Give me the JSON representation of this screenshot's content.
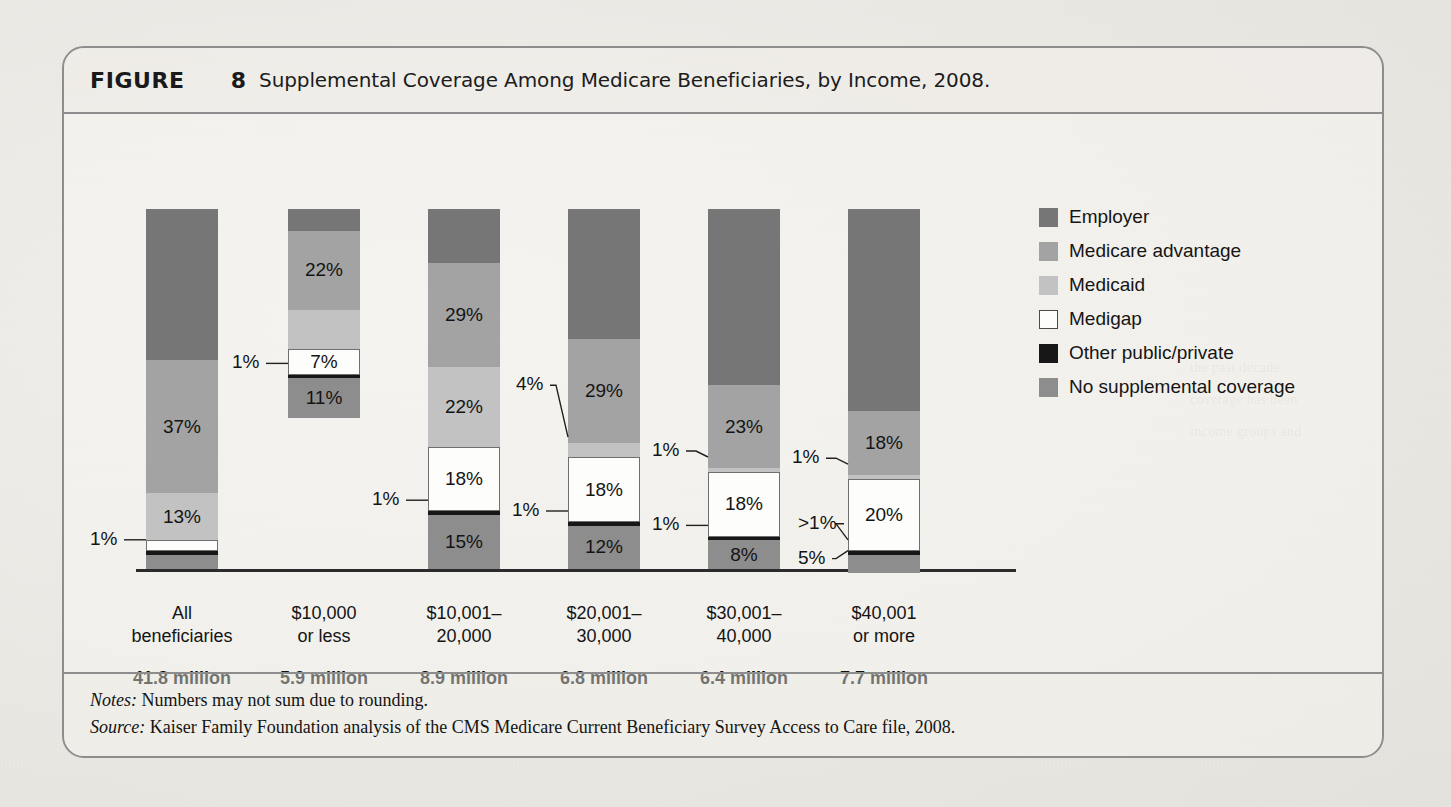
{
  "figure": {
    "label": "FIGURE",
    "number": "8",
    "title": "Supplemental Coverage Among Medicare Beneficiaries, by Income, 2008."
  },
  "footer": {
    "notes_label": "Notes:",
    "notes_text": " Numbers may not sum due to rounding.",
    "source_label": "Source:",
    "source_text": " Kaiser Family Foundation analysis of the CMS Medicare Current Beneficiary Survey Access to Care file, 2008."
  },
  "legend": {
    "items": [
      {
        "label": "Employer",
        "color": "#767676"
      },
      {
        "label": "Medicare advantage",
        "color": "#a3a3a3"
      },
      {
        "label": "Medicaid",
        "color": "#c2c2c2"
      },
      {
        "label": "Medigap",
        "color": "#fdfdfb"
      },
      {
        "label": "Other public/private",
        "color": "#171717"
      },
      {
        "label": "No supplemental coverage",
        "color": "#8d8d8d"
      }
    ]
  },
  "chart_data": {
    "type": "bar",
    "subtype": "stacked-100",
    "title": "Supplemental Coverage Among Medicare Beneficiaries, by Income, 2008.",
    "xlabel": "",
    "ylabel": "",
    "ylim": [
      0,
      100
    ],
    "grid": false,
    "legend_position": "right",
    "categories": [
      "All beneficiaries",
      "$10,000 or less",
      "$10,001–20,000",
      "$20,001–30,000",
      "$30,001–40,000",
      "$40,001 or more"
    ],
    "category_lines": [
      [
        "All",
        "beneficiaries"
      ],
      [
        "$10,000",
        "or less"
      ],
      [
        "$10,001–",
        "20,000"
      ],
      [
        "$20,001–",
        "30,000"
      ],
      [
        "$30,001–",
        "40,000"
      ],
      [
        "$40,001",
        "or more"
      ]
    ],
    "population_counts": [
      "41.8 million",
      "5.9 million",
      "8.9 million",
      "6.8 million",
      "6.4 million",
      "7.7 million"
    ],
    "series": [
      {
        "name": "Employer",
        "color": "#767676",
        "values": [
          42,
          6,
          15,
          36,
          49,
          56
        ],
        "labels": [
          "",
          "",
          "",
          "",
          "",
          ""
        ]
      },
      {
        "name": "Medicare advantage",
        "color": "#a3a3a3",
        "values": [
          37,
          22,
          29,
          29,
          23,
          18
        ],
        "labels": [
          "37%",
          "22%",
          "29%",
          "29%",
          "23%",
          "18%"
        ]
      },
      {
        "name": "Medicaid",
        "color": "#c2c2c2",
        "values": [
          13,
          11,
          22,
          4,
          1,
          1
        ],
        "labels": [
          "13%",
          "",
          "22%",
          "4%",
          "1%",
          "1%"
        ]
      },
      {
        "name": "Medigap",
        "color": "#fdfdfb",
        "values": [
          3,
          7,
          18,
          18,
          18,
          20
        ],
        "labels": [
          "3%",
          "7%",
          "18%",
          "18%",
          "18%",
          "20%"
        ]
      },
      {
        "name": "Other public/private",
        "color": "#171717",
        "values": [
          1,
          1,
          1,
          1,
          1,
          1
        ],
        "labels": [
          "1%",
          "1%",
          "1%",
          "1%",
          "1%",
          ">1%"
        ]
      },
      {
        "name": "No supplemental coverage",
        "color": "#8d8d8d",
        "values": [
          4,
          11,
          15,
          12,
          8,
          5
        ],
        "labels": [
          "4%",
          "11%",
          "15%",
          "12%",
          "8%",
          "5%"
        ]
      }
    ],
    "callouts": [
      {
        "text": "1%",
        "col": 0,
        "series": "Other public/private"
      },
      {
        "text": "1%",
        "col": 1,
        "series": "Other public/private"
      },
      {
        "text": "1%",
        "col": 2,
        "series": "Other public/private"
      },
      {
        "text": "4%",
        "col": 3,
        "series": "Medicaid"
      },
      {
        "text": "1%",
        "col": 3,
        "series": "Other public/private"
      },
      {
        "text": "1%",
        "col": 4,
        "series": "Medicaid"
      },
      {
        "text": "1%",
        "col": 4,
        "series": "Other public/private"
      },
      {
        "text": "1%",
        "col": 5,
        "series": "Medicaid"
      },
      {
        "text": ">1%",
        "col": 5,
        "series": "Other public/private"
      },
      {
        "text": "5%",
        "col": 5,
        "series": "No supplemental coverage"
      }
    ]
  }
}
